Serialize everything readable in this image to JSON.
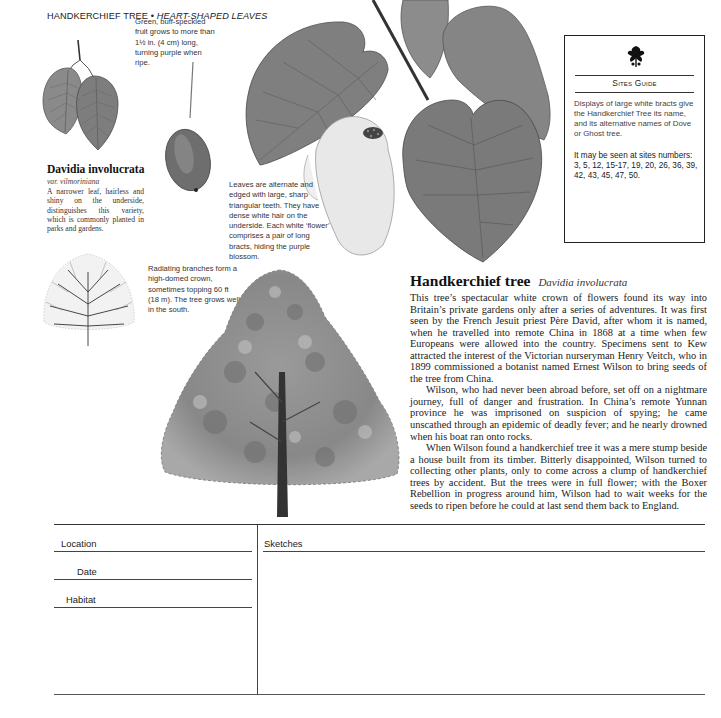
{
  "header": {
    "title": "HANDKERCHIEF TREE",
    "separator": " • ",
    "subtitle": "HEART-SHAPED LEAVES"
  },
  "captions": {
    "fruit": "Green, buff-speckled fruit grows to more than 1½ in. (4 cm) long, turning purple when ripe.",
    "leaves": "Leaves are alternate and edged with large, sharp triangular teeth. They have dense white hair on the underside. Each white ‘flower’ comprises a pair of long bracts, hiding the purple blossom.",
    "crown": "Radiating branches form a high-domed crown, sometimes topping 60 ft (18 m). The tree grows well in the south."
  },
  "variety": {
    "name": "Davidia involucrata",
    "subname": "var. vilmoriniana",
    "description": "A narrower leaf, hairless and shiny on the underside, distinguishes this variety, which is commonly planted in parks and gardens."
  },
  "sites_guide": {
    "logo_icon": "oak-leaf-logo-icon",
    "title": "Sites Guide",
    "description": "Displays of large white bracts give the Handkerchief Tree its name, and its alternative names of Dove or Ghost tree.",
    "sites_text": "It may be seen at sites numbers: 3, 5, 12, 15-17, 19, 20, 26, 36, 39, 42, 43, 45, 47, 50."
  },
  "article": {
    "common_name": "Handkerchief tree",
    "latin_name": "Davidia involucrata",
    "paragraphs": [
      "This tree’s spectacular white crown of flowers found its way into Britain’s private gardens only after a series of adventures. It was first seen by the French Jesuit priest Père David, after whom it is named, when he travelled into remote China in 1868 at a time when few Europeans were allowed into the country. Specimens sent to Kew attracted the interest of the Victorian nurseryman Henry Veitch, who in 1899 commissioned a botanist named Ernest Wilson to bring seeds of the tree from China.",
      "Wilson, who had never been abroad before, set off on a nightmare journey, full of danger and frustration. In China’s remote Yunnan province he was imprisoned on suspicion of spying; he came unscathed through an epidemic of deadly fever; and he nearly drowned when his boat ran onto rocks.",
      "When Wilson found a handkerchief tree it was a mere stump beside a house built from its timber. Bitterly disappointed, Wilson turned to collecting other plants, only to come across a clump of handkerchief trees by accident. But the trees were in full flower; with the Boxer Rebellion in progress around him, Wilson had to wait weeks for the seeds to ripen before he could at last send them back to England."
    ]
  },
  "form": {
    "location_label": "Location",
    "date_label": "Date",
    "habitat_label": "Habitat",
    "sketches_label": "Sketches"
  }
}
